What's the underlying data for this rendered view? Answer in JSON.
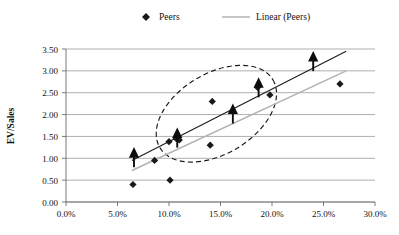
{
  "chart_data": {
    "type": "scatter",
    "title": "",
    "xlabel": "",
    "ylabel": "EV/Sales",
    "xlim": [
      0,
      30
    ],
    "ylim": [
      0,
      3.5
    ],
    "grid": true,
    "legend_position": "top-center",
    "x_tick_labels": [
      "0.0%",
      "5.0%",
      "10.0%",
      "15.0%",
      "20.0%",
      "25.0%",
      "30.0%"
    ],
    "x_ticks": [
      0,
      5,
      10,
      15,
      20,
      25,
      30
    ],
    "y_tick_labels": [
      "0.00",
      "0.50",
      "1.00",
      "1.50",
      "2.00",
      "2.50",
      "3.00",
      "3.50"
    ],
    "y_ticks": [
      0,
      0.5,
      1.0,
      1.5,
      2.0,
      2.5,
      3.0,
      3.5
    ],
    "legend": [
      {
        "name": "Peers",
        "marker": "diamond",
        "color": "#1a1a1a"
      },
      {
        "name": "Linear (Peers)",
        "marker": "line",
        "color": "#9a9a9a"
      }
    ],
    "series": [
      {
        "name": "Peers",
        "marker": "diamond",
        "points": [
          {
            "x": 6.5,
            "y": 0.4
          },
          {
            "x": 8.6,
            "y": 0.95
          },
          {
            "x": 10.1,
            "y": 0.5
          },
          {
            "x": 10.0,
            "y": 1.38
          },
          {
            "x": 10.7,
            "y": 1.45
          },
          {
            "x": 11.0,
            "y": 1.42
          },
          {
            "x": 14.0,
            "y": 1.3
          },
          {
            "x": 14.2,
            "y": 2.3
          },
          {
            "x": 18.6,
            "y": 2.62
          },
          {
            "x": 19.8,
            "y": 2.45
          },
          {
            "x": 26.6,
            "y": 2.7
          }
        ]
      },
      {
        "name": "Peers (arrow-marked)",
        "marker": "arrow-up",
        "points": [
          {
            "x": 6.6,
            "y": 1.0
          },
          {
            "x": 10.8,
            "y": 1.45
          },
          {
            "x": 16.2,
            "y": 2.0
          },
          {
            "x": 18.7,
            "y": 2.6
          },
          {
            "x": 24.0,
            "y": 3.2
          }
        ]
      }
    ],
    "trend_lines": [
      {
        "name": "Linear (Peers) dark",
        "color": "#1a1a1a",
        "x0": 6.4,
        "y0": 0.95,
        "x1": 27.2,
        "y1": 3.45
      },
      {
        "name": "Linear (Peers) gray",
        "color": "#b3b3b3",
        "x0": 6.4,
        "y0": 0.72,
        "x1": 27.2,
        "y1": 3.0
      }
    ],
    "annotations": [
      {
        "type": "ellipse",
        "style": "dashed",
        "cx": 14.6,
        "cy": 2.02,
        "rx": 6.4,
        "ry": 0.92,
        "rotation_deg": -31
      }
    ]
  }
}
